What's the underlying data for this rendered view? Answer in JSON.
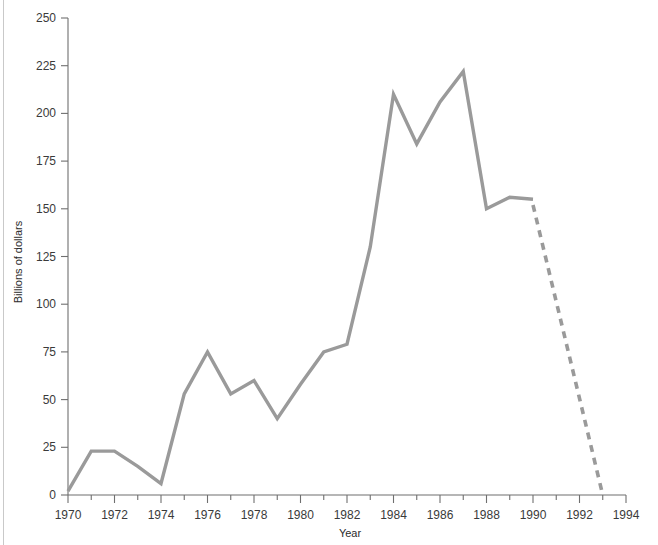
{
  "chart_data": {
    "type": "line",
    "title": "",
    "xlabel": "Year",
    "ylabel": "Billions of dollars",
    "xlim": [
      1970,
      1994
    ],
    "ylim": [
      0,
      250
    ],
    "grid": false,
    "legend": "none",
    "x_tick_step": 1,
    "x_label_step": 2,
    "y_tick_step": 25,
    "x_tick_values": [
      1970,
      1971,
      1972,
      1973,
      1974,
      1975,
      1976,
      1977,
      1978,
      1979,
      1980,
      1981,
      1982,
      1983,
      1984,
      1985,
      1986,
      1987,
      1988,
      1989,
      1990,
      1991,
      1992,
      1993,
      1994
    ],
    "x_tick_labels": [
      "1970",
      "",
      "1972",
      "",
      "1974",
      "",
      "1976",
      "",
      "1978",
      "",
      "1980",
      "",
      "1982",
      "",
      "1984",
      "",
      "1986",
      "",
      "1988",
      "",
      "1990",
      "",
      "1992",
      "",
      "1994"
    ],
    "y_tick_values": [
      0,
      25,
      50,
      75,
      100,
      125,
      150,
      175,
      200,
      225,
      250
    ],
    "y_tick_labels": [
      "0",
      "25",
      "50",
      "75",
      "100",
      "125",
      "150",
      "175",
      "200",
      "225",
      "250"
    ],
    "series": [
      {
        "name": "Actual",
        "style": "solid",
        "color": "#9a9a9a",
        "x": [
          1970,
          1971,
          1972,
          1973,
          1974,
          1975,
          1976,
          1977,
          1978,
          1979,
          1980,
          1981,
          1982,
          1983,
          1984,
          1985,
          1986,
          1987,
          1988,
          1989,
          1990
        ],
        "values": [
          2,
          23,
          23,
          15,
          6,
          53,
          75,
          53,
          60,
          40,
          58,
          75,
          79,
          130,
          210,
          184,
          206,
          222,
          150,
          156,
          155
        ]
      },
      {
        "name": "Projected",
        "style": "dashed",
        "color": "#9a9a9a",
        "x": [
          1990,
          1993
        ],
        "values": [
          152,
          0
        ]
      }
    ],
    "axis_color": "#6f6f6f",
    "text_color": "#2b2b2b",
    "background": "#ffffff"
  }
}
